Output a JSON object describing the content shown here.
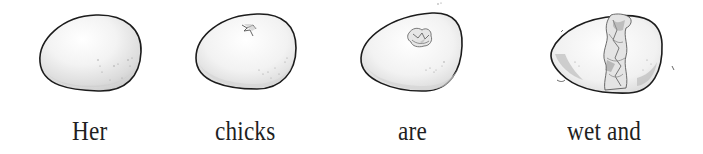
{
  "illustration": {
    "panels": [
      {
        "stage": "intact-egg",
        "caption": "Her"
      },
      {
        "stage": "first-crack",
        "caption": "chicks"
      },
      {
        "stage": "hole-pecked",
        "caption": "are"
      },
      {
        "stage": "cracked-open",
        "caption": "wet and"
      }
    ]
  },
  "colors": {
    "background": "#ffffff",
    "outline": "#1c1c1c",
    "shade_light": "#ececec",
    "shade_mid": "#d4d4d4",
    "shade_dark": "#a8a8a8",
    "text": "#1f1f1f"
  }
}
